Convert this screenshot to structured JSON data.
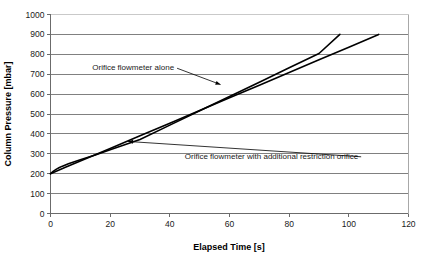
{
  "chart_data": {
    "type": "line",
    "title": "",
    "xlabel": "Elapsed Time [s]",
    "ylabel": "Column Pressure [mbar]",
    "xlim": [
      0,
      120
    ],
    "ylim": [
      0,
      1000
    ],
    "xticks": [
      0,
      20,
      40,
      60,
      80,
      100,
      120
    ],
    "yticks": [
      0,
      100,
      200,
      300,
      400,
      500,
      600,
      700,
      800,
      900,
      1000
    ],
    "xtick_labels": [
      "0",
      "20",
      "40",
      "60",
      "80",
      "100",
      "120"
    ],
    "ytick_labels": [
      "0",
      "100",
      "200",
      "300",
      "400",
      "500",
      "600",
      "700",
      "800",
      "900",
      "1000"
    ],
    "grid": {
      "horizontal": true,
      "vertical": false,
      "color": "#808080"
    },
    "legend": {
      "position": "inline-annotations",
      "visible": false
    },
    "line_color": "#000000",
    "series": [
      {
        "name": "Orifice flowmeter alone",
        "x": [
          0,
          1,
          2,
          3,
          4,
          6,
          8,
          10,
          15,
          20,
          30,
          40,
          50,
          60,
          70,
          80,
          90,
          97
        ],
        "y": [
          200,
          213,
          223,
          231,
          238,
          250,
          260,
          270,
          294,
          320,
          372,
          444,
          516,
          588,
          660,
          732,
          804,
          900
        ]
      },
      {
        "name": "Orifice flowmeter with additional restriction orifice",
        "x": [
          0,
          5,
          10,
          20,
          30,
          40,
          50,
          60,
          70,
          80,
          90,
          100,
          110
        ],
        "y": [
          200,
          232,
          264,
          327,
          391,
          454,
          518,
          582,
          645,
          709,
          773,
          836,
          900
        ]
      }
    ],
    "annotations": [
      {
        "id": "annotation-upper",
        "text": "Orifice flowmeter alone",
        "text_x": 14,
        "text_y": 735,
        "arrow_to_x": 57,
        "arrow_to_y": 648
      },
      {
        "id": "annotation-lower",
        "text": "Orifice flowmeter with additional restriction orifice",
        "text_x": 45,
        "text_y": 290,
        "arrow_to_x": 26,
        "arrow_to_y": 362
      }
    ]
  }
}
